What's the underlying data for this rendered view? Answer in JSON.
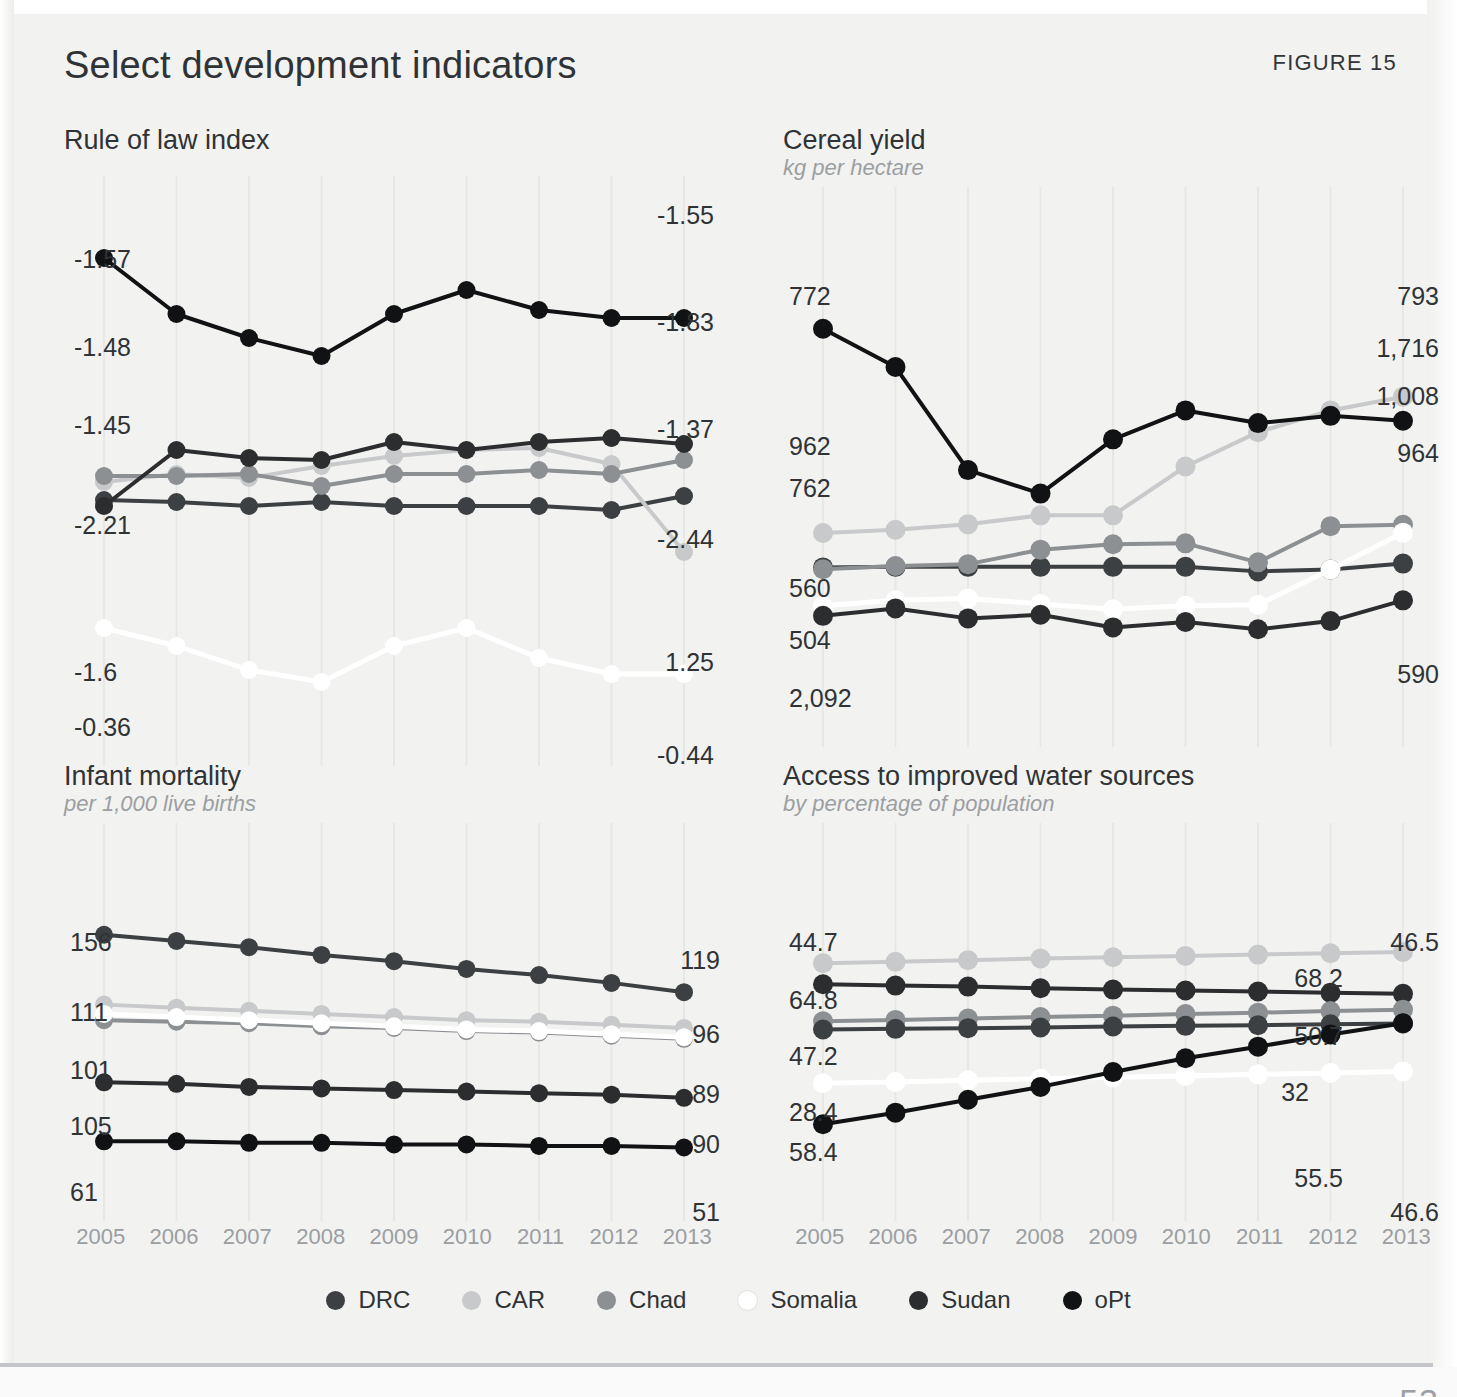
{
  "figure": {
    "label": "FIGURE 15",
    "title": "Select development indicators",
    "page_number": "53"
  },
  "years": [
    "2005",
    "2006",
    "2007",
    "2008",
    "2009",
    "2010",
    "2011",
    "2012",
    "2013"
  ],
  "series_colors": {
    "DRC": "#3c4042",
    "CAR": "#c7c9ca",
    "Chad": "#8c9093",
    "Somalia": "#ffffff",
    "Sudan": "#2b2d2f",
    "oPt": "#111214"
  },
  "legend": {
    "items": [
      {
        "name": "DRC",
        "label": "DRC",
        "color": "#3c4042"
      },
      {
        "name": "CAR",
        "label": "CAR",
        "color": "#c7c9ca"
      },
      {
        "name": "Chad",
        "label": "Chad",
        "color": "#8c9093"
      },
      {
        "name": "Somalia",
        "label": "Somalia",
        "color": "#ffffff"
      },
      {
        "name": "Sudan",
        "label": "Sudan",
        "color": "#2b2d2f"
      },
      {
        "name": "oPt",
        "label": "oPt",
        "color": "#111214"
      }
    ]
  },
  "chart_data": [
    {
      "id": "rule-of-law",
      "type": "line",
      "title": "Rule of law index",
      "subtitle": "",
      "xlabel": "",
      "ylabel": "",
      "x": [
        "2005",
        "2006",
        "2007",
        "2008",
        "2009",
        "2010",
        "2011",
        "2012",
        "2013"
      ],
      "grid": true,
      "legend_position": "bottom-shared",
      "ylim": [
        -2.6,
        -0.2
      ],
      "series": [
        {
          "name": "DRC",
          "color": "#3c4042",
          "start_label": "-1.57",
          "end_label": "-1.55",
          "values": [
            -1.57,
            -1.58,
            -1.6,
            -1.58,
            -1.6,
            -1.6,
            -1.6,
            -1.62,
            -1.55
          ]
        },
        {
          "name": "CAR",
          "color": "#c7c9ca",
          "start_label": "-1.48",
          "end_label": "-1.83",
          "values": [
            -1.48,
            -1.44,
            -1.46,
            -1.4,
            -1.35,
            -1.32,
            -1.31,
            -1.39,
            -1.83
          ]
        },
        {
          "name": "Chad",
          "color": "#8c9093",
          "start_label": "-1.45",
          "end_label": "-1.37",
          "values": [
            -1.45,
            -1.45,
            -1.44,
            -1.5,
            -1.44,
            -1.44,
            -1.42,
            -1.44,
            -1.37
          ]
        },
        {
          "name": "Somalia",
          "color": "#ffffff",
          "start_label": "-2.21",
          "end_label": "-2.44",
          "values": [
            -2.21,
            -2.3,
            -2.42,
            -2.48,
            -2.3,
            -2.21,
            -2.36,
            -2.44,
            -2.44
          ]
        },
        {
          "name": "Sudan",
          "color": "#2b2d2f",
          "start_label": "-1.6",
          "end_label": "1.25",
          "values": [
            -1.6,
            -1.32,
            -1.36,
            -1.37,
            -1.28,
            -1.32,
            -1.28,
            -1.26,
            -1.29
          ]
        },
        {
          "name": "oPt",
          "color": "#111214",
          "start_label": "-0.36",
          "end_label": "-0.44",
          "values": [
            -0.36,
            -0.64,
            -0.76,
            -0.85,
            -0.64,
            -0.52,
            -0.62,
            -0.66,
            -0.66
          ]
        }
      ]
    },
    {
      "id": "cereal-yield",
      "type": "line",
      "title": "Cereal yield",
      "subtitle": "kg per hectare",
      "xlabel": "",
      "ylabel": "",
      "x": [
        "2005",
        "2006",
        "2007",
        "2008",
        "2009",
        "2010",
        "2011",
        "2012",
        "2013"
      ],
      "grid": true,
      "legend_position": "bottom-shared",
      "ylim": [
        0,
        2400
      ],
      "series": [
        {
          "name": "DRC",
          "color": "#3c4042",
          "start_label": "772",
          "end_label": "793",
          "values": [
            772,
            775,
            775,
            775,
            775,
            775,
            750,
            760,
            793
          ]
        },
        {
          "name": "CAR",
          "color": "#c7c9ca",
          "start_label": "962",
          "end_label": "1,716",
          "values": [
            962,
            980,
            1010,
            1060,
            1060,
            1330,
            1520,
            1640,
            1716
          ]
        },
        {
          "name": "Chad",
          "color": "#8c9093",
          "start_label": "762",
          "end_label": "1,008",
          "values": [
            762,
            780,
            790,
            870,
            900,
            905,
            800,
            1000,
            1008
          ]
        },
        {
          "name": "Somalia",
          "color": "#ffffff",
          "start_label": "560",
          "end_label": "964",
          "values": [
            560,
            590,
            600,
            570,
            540,
            560,
            565,
            760,
            964
          ]
        },
        {
          "name": "Sudan",
          "color": "#2b2d2f",
          "start_label": "504",
          "end_label": "590",
          "values": [
            504,
            545,
            490,
            510,
            440,
            470,
            430,
            475,
            590
          ]
        },
        {
          "name": "oPt",
          "color": "#111214",
          "start_label": "2,092",
          "end_label": "1,583",
          "values": [
            2092,
            1880,
            1310,
            1180,
            1480,
            1640,
            1570,
            1610,
            1583
          ]
        }
      ]
    },
    {
      "id": "infant-mortality",
      "type": "line",
      "title": "Infant mortality",
      "subtitle": "per 1,000 live births",
      "xlabel": "",
      "ylabel": "",
      "x": [
        "2005",
        "2006",
        "2007",
        "2008",
        "2009",
        "2010",
        "2011",
        "2012",
        "2013"
      ],
      "grid": true,
      "legend_position": "bottom-shared",
      "ylim": [
        0,
        170
      ],
      "series": [
        {
          "name": "DRC",
          "color": "#3c4042",
          "start_label": "156",
          "end_label": "119",
          "values": [
            156,
            152,
            148,
            143,
            139,
            134,
            130,
            125,
            119
          ]
        },
        {
          "name": "CAR",
          "color": "#c7c9ca",
          "start_label": "111",
          "end_label": "96",
          "values": [
            111,
            109,
            107,
            105,
            103,
            101,
            100,
            98,
            96
          ]
        },
        {
          "name": "Chad",
          "color": "#8c9093",
          "start_label": "101",
          "end_label": "89",
          "values": [
            101,
            100,
            99,
            97,
            96,
            94,
            93,
            91,
            89
          ]
        },
        {
          "name": "Somalia",
          "color": "#ffffff",
          "start_label": "105",
          "end_label": "90",
          "values": [
            105,
            103,
            101,
            99,
            97,
            95,
            94,
            92,
            90
          ]
        },
        {
          "name": "Sudan",
          "color": "#2b2d2f",
          "start_label": "61",
          "end_label": "51",
          "values": [
            61,
            60,
            58,
            57,
            56,
            55,
            54,
            53,
            51
          ]
        },
        {
          "name": "oPt",
          "color": "#111214",
          "start_label": "23",
          "end_label": "19",
          "values": [
            23,
            23,
            22,
            22,
            21,
            21,
            20,
            20,
            19
          ]
        }
      ]
    },
    {
      "id": "water-access",
      "type": "line",
      "title": "Access to improved water sources",
      "subtitle": "by percentage of population",
      "xlabel": "",
      "ylabel": "",
      "x": [
        "2005",
        "2006",
        "2007",
        "2008",
        "2009",
        "2010",
        "2011",
        "2012",
        "2013"
      ],
      "grid": true,
      "legend_position": "bottom-shared",
      "ylim": [
        0,
        80
      ],
      "series": [
        {
          "name": "CAR",
          "color": "#c7c9ca",
          "start_label": "64.8",
          "end_label": "68.2",
          "values": [
            64.8,
            65.2,
            65.7,
            66.2,
            66.6,
            67.0,
            67.4,
            67.8,
            68.2
          ]
        },
        {
          "name": "Sudan",
          "color": "#2b2d2f",
          "start_label": "58.4",
          "end_label": "55.5",
          "values": [
            58.4,
            58.0,
            57.7,
            57.2,
            56.8,
            56.5,
            56.2,
            55.8,
            55.5
          ]
        },
        {
          "name": "Chad",
          "color": "#8c9093",
          "start_label": "47.2",
          "end_label": "50.7",
          "values": [
            47.2,
            47.6,
            48.0,
            48.5,
            48.9,
            49.4,
            49.8,
            50.3,
            50.7
          ]
        },
        {
          "name": "DRC",
          "color": "#3c4042",
          "start_label": "44.7",
          "end_label": "46.5",
          "values": [
            44.7,
            44.9,
            45.1,
            45.3,
            45.6,
            45.8,
            46.0,
            46.3,
            46.5
          ]
        },
        {
          "name": "Somalia",
          "color": "#ffffff",
          "start_label": "28.4",
          "end_label": "32",
          "values": [
            28.4,
            28.8,
            29.3,
            29.8,
            30.2,
            30.6,
            31.1,
            31.5,
            32.0
          ]
        },
        {
          "name": "oPt",
          "color": "#111214",
          "start_label": "16",
          "end_label": "46.6",
          "values": [
            16.0,
            19.5,
            23.4,
            27.3,
            31.8,
            36.0,
            39.5,
            43.2,
            46.6
          ]
        }
      ]
    }
  ]
}
